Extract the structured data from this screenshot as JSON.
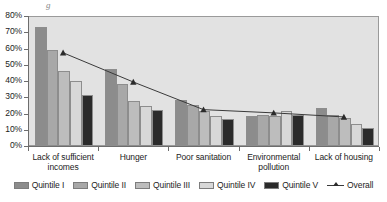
{
  "chart_data": {
    "type": "bar",
    "title": "",
    "xlabel": "",
    "ylabel": "",
    "ylim": [
      0,
      80
    ],
    "ytick_labels": [
      "0%",
      "10%",
      "20%",
      "30%",
      "40%",
      "50%",
      "60%",
      "70%",
      "80%"
    ],
    "ytick_values": [
      0,
      10,
      20,
      30,
      40,
      50,
      60,
      70,
      80
    ],
    "grid": false,
    "legend_position": "bottom",
    "categories": [
      "Lack of sufficient incomes",
      "Hunger",
      "Poor sanitation",
      "Environmental pollution",
      "Lack of housing"
    ],
    "category_lines": [
      [
        "Lack of sufficient",
        "incomes"
      ],
      [
        "Hunger"
      ],
      [
        "Poor sanitation"
      ],
      [
        "Environmental",
        "pollution"
      ],
      [
        "Lack of housing"
      ]
    ],
    "series": [
      {
        "name": "Quintile I",
        "type": "bar",
        "color": "#8c8c8c",
        "values": [
          74,
          48,
          29,
          19,
          24
        ]
      },
      {
        "name": "Quintile II",
        "type": "bar",
        "color": "#a8a8a8",
        "values": [
          60,
          39,
          26,
          20,
          20
        ]
      },
      {
        "name": "Quintile III",
        "type": "bar",
        "color": "#bdbdbd",
        "values": [
          47,
          28.5,
          22,
          19,
          18
        ]
      },
      {
        "name": "Quintile IV",
        "type": "bar",
        "color": "#d8d8d8",
        "values": [
          40.5,
          25,
          19,
          22,
          14
        ]
      },
      {
        "name": "Quintile V",
        "type": "bar",
        "color": "#2b2b2b",
        "values": [
          32,
          23,
          17,
          19.5,
          12
        ]
      },
      {
        "name": "Overall",
        "type": "line",
        "color": "#3a3a3a",
        "values": [
          58,
          40,
          23,
          21,
          18.5
        ]
      }
    ]
  },
  "legend": {
    "items": [
      {
        "label": "Quintile I",
        "swatch": "#8c8c8c",
        "kind": "swatch"
      },
      {
        "label": "Quintile II",
        "swatch": "#a8a8a8",
        "kind": "swatch"
      },
      {
        "label": "Quintile III",
        "swatch": "#bdbdbd",
        "kind": "swatch"
      },
      {
        "label": "Quintile IV",
        "swatch": "#d8d8d8",
        "kind": "swatch"
      },
      {
        "label": "Quintile V",
        "swatch": "#2b2b2b",
        "kind": "swatch"
      },
      {
        "label": "Overall",
        "swatch": "#3a3a3a",
        "kind": "line"
      }
    ]
  },
  "artifact": {
    "top_clipped_text": "g"
  }
}
